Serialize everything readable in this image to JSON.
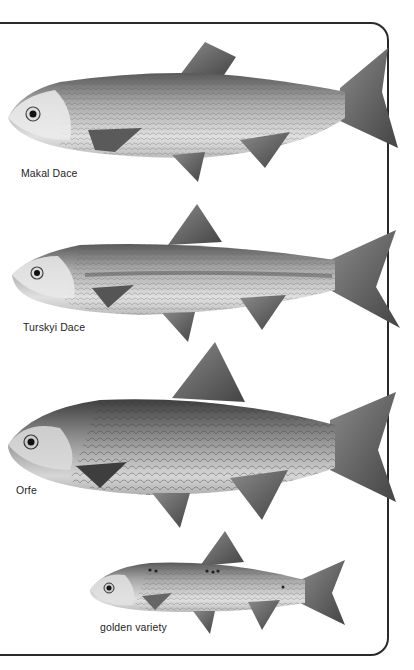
{
  "plate": {
    "species": [
      {
        "name": "Makal Dace",
        "caption_pos": {
          "x": 21,
          "y": 167
        }
      },
      {
        "name": "Turskyi Dace",
        "caption_pos": {
          "x": 23,
          "y": 321
        }
      },
      {
        "name": "Orfe",
        "caption_pos": {
          "x": 16,
          "y": 484
        }
      },
      {
        "name": "golden variety",
        "caption_pos": {
          "x": 100,
          "y": 621
        }
      }
    ]
  },
  "colors": {
    "border": "#2a2a2a",
    "caption": "#1e1e1e",
    "fish_light": "#d9d9d9",
    "fish_mid": "#9a9a9a",
    "fish_dark": "#4a4a4a"
  }
}
